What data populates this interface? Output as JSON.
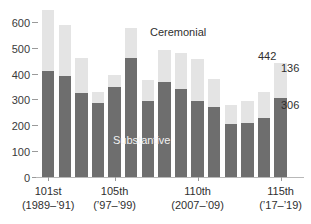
{
  "chart_data": {
    "type": "bar",
    "subtype": "stacked-bar",
    "title": "",
    "subtitle": "",
    "xlabel": "",
    "ylabel": "",
    "ylim": [
      0,
      660
    ],
    "grid": false,
    "legend_position": "inside-plot",
    "y_ticks": [
      0,
      100,
      200,
      300,
      400,
      500,
      600
    ],
    "y_tick_labels": [
      "0",
      "100",
      "200",
      "300",
      "400",
      "500",
      "600"
    ],
    "series": [
      {
        "name": "Substantive",
        "color": "#6e6e6e",
        "values": [
          410,
          393,
          325,
          288,
          350,
          462,
          295,
          367,
          341,
          295,
          270,
          206,
          210,
          230,
          306
        ]
      },
      {
        "name": "Ceremonial",
        "color": "#e4e4e4",
        "values": [
          237,
          197,
          138,
          42,
          45,
          116,
          80,
          126,
          139,
          162,
          110,
          74,
          84,
          98,
          136
        ]
      }
    ],
    "totals": [
      647,
      590,
      463,
      330,
      395,
      578,
      375,
      493,
      480,
      457,
      380,
      280,
      294,
      328,
      442
    ],
    "categories": [
      "101st",
      "102nd",
      "103rd",
      "104th",
      "105th",
      "106th",
      "107th",
      "108th",
      "109th",
      "110th",
      "111th",
      "112th",
      "113th",
      "114th",
      "115th"
    ],
    "x_group_labels": [
      {
        "name": "101st",
        "years": "(1989–’91)",
        "bar_index": 0
      },
      {
        "name": "105th",
        "years": "(’97–’99)",
        "bar_index": 4
      },
      {
        "name": "110th",
        "years": "(2007–’09)",
        "bar_index": 9
      },
      {
        "name": "115th",
        "years": "(’17–’19)",
        "bar_index": 14
      }
    ],
    "annotations": [
      {
        "name": "total-last-bar",
        "text": "442"
      },
      {
        "name": "ceremonial-last-bar",
        "text": "136"
      },
      {
        "name": "substantive-last-bar",
        "text": "306"
      }
    ]
  },
  "legend": {
    "ceremonial_label": "Ceremonial",
    "substantive_label": "Substantive"
  },
  "colors": {
    "ceremonial": "#e4e4e4",
    "substantive": "#6e6e6e",
    "axis": "#9a9a9a",
    "text": "#2f2f2f",
    "background": "#ffffff"
  }
}
